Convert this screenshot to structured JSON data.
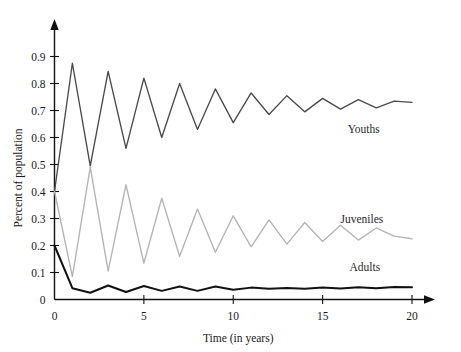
{
  "chart_data": {
    "type": "line",
    "title": "",
    "xlabel": "Time (in years)",
    "ylabel": "Percent of population",
    "xlim": [
      0,
      20
    ],
    "ylim": [
      0,
      0.95
    ],
    "grid": false,
    "legend_position": "inline-right",
    "xticks": [
      "0",
      "5",
      "10",
      "15",
      "20"
    ],
    "xtick_values": [
      0,
      5,
      10,
      15,
      20
    ],
    "yticks": [
      "0",
      "0.1",
      "0.2",
      "0.3",
      "0.4",
      "0.5",
      "0.6",
      "0.7",
      "0.8",
      "0.9"
    ],
    "ytick_values": [
      0,
      0.1,
      0.2,
      0.3,
      0.4,
      0.5,
      0.6,
      0.7,
      0.8,
      0.9
    ],
    "x": [
      0,
      1,
      2,
      3,
      4,
      5,
      6,
      7,
      8,
      9,
      10,
      11,
      12,
      13,
      14,
      15,
      16,
      17,
      18,
      19,
      20
    ],
    "series": [
      {
        "name": "Youths",
        "color": "#4a4a4a",
        "label_x": 16.4,
        "label_y": 0.615,
        "values": [
          0.4,
          0.875,
          0.495,
          0.845,
          0.56,
          0.82,
          0.6,
          0.8,
          0.63,
          0.78,
          0.655,
          0.765,
          0.685,
          0.755,
          0.695,
          0.745,
          0.705,
          0.74,
          0.71,
          0.735,
          0.73
        ]
      },
      {
        "name": "Juveniles",
        "color": "#b4b4b4",
        "label_x": 16.0,
        "label_y": 0.285,
        "values": [
          0.4,
          0.085,
          0.49,
          0.105,
          0.425,
          0.135,
          0.375,
          0.16,
          0.335,
          0.175,
          0.31,
          0.195,
          0.295,
          0.205,
          0.285,
          0.215,
          0.275,
          0.22,
          0.265,
          0.235,
          0.225
        ]
      },
      {
        "name": "Adults",
        "color": "#111111",
        "label_x": 16.5,
        "label_y": 0.105,
        "values": [
          0.2,
          0.042,
          0.025,
          0.052,
          0.028,
          0.05,
          0.032,
          0.048,
          0.032,
          0.048,
          0.036,
          0.044,
          0.04,
          0.043,
          0.04,
          0.044,
          0.041,
          0.045,
          0.042,
          0.046,
          0.045
        ]
      }
    ]
  }
}
